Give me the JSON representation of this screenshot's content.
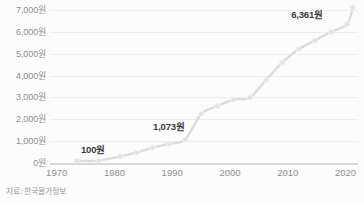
{
  "chart_data": {
    "type": "line",
    "title": "",
    "subtitle": "",
    "xlabel": "",
    "ylabel": "",
    "unit_suffix": "원",
    "xlim": [
      1965,
      2022
    ],
    "ylim": [
      0,
      7000
    ],
    "grid": true,
    "legend_position": "none",
    "line_color": "#dcdcdc",
    "marker_color": "#e2e2e2",
    "annotation_color": "#3a3a3a",
    "gridline_color": "#ededed",
    "baseline_color": "#d8d8d8",
    "background_color": "#fcfcfc",
    "tick_label_color": "#8e8e8e",
    "ytick_labels": [
      "7,000원",
      "6,000원",
      "5,000원",
      "4,000원",
      "3,000원",
      "2,000원",
      "1,000원",
      "0원"
    ],
    "ytick_values": [
      7000,
      6000,
      5000,
      4000,
      3000,
      2000,
      1000,
      0
    ],
    "xtick_labels": [
      "1970",
      "1980",
      "1990",
      "2000",
      "2010",
      "2020"
    ],
    "xtick_values": [
      1970,
      1980,
      1990,
      2000,
      2010,
      2020
    ],
    "x": [
      1970,
      1974,
      1978,
      1981,
      1984,
      1987,
      1990,
      1993,
      1996,
      1999,
      2002,
      2005,
      2008,
      2011,
      2014,
      2017,
      2020,
      2021
    ],
    "values": [
      100,
      110,
      300,
      480,
      700,
      880,
      1073,
      2250,
      2600,
      2900,
      3000,
      3800,
      4600,
      5200,
      5600,
      6000,
      6361,
      7100
    ],
    "series": [
      {
        "name": "자장면 가격",
        "values": [
          100,
          110,
          300,
          480,
          700,
          880,
          1073,
          2250,
          2600,
          2900,
          3000,
          3800,
          4600,
          5200,
          5600,
          6000,
          6361,
          7100
        ]
      }
    ],
    "annotations": [
      {
        "label": "100원",
        "x": 1970,
        "y": 100,
        "value": 100
      },
      {
        "label": "1,073원",
        "x": 1990,
        "y": 1073,
        "value": 1073
      },
      {
        "label": "6,361원",
        "x": 2020,
        "y": 6361,
        "value": 6361
      }
    ]
  },
  "source": {
    "note": "자료: 한국물가정보"
  }
}
